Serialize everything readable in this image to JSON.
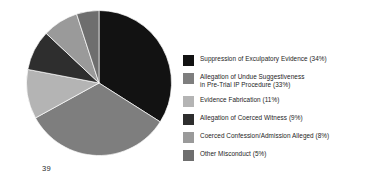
{
  "page": {
    "number": "39"
  },
  "chart_data": {
    "type": "pie",
    "title": "",
    "xlabel": "",
    "ylabel": "",
    "legend_position": "right",
    "grid": false,
    "start_angle_deg": 0,
    "direction": "clockwise",
    "categories": [
      "Suppression of Exculpatory Evidence",
      "Allegation of Undue Suggestiveness\nin Pre-Trial IP Procedure",
      "Evidence Fabrication",
      "Allegation of Coerced Witness",
      "Coerced Confession/Admission Alleged",
      "Other Misconduct"
    ],
    "values": [
      34,
      33,
      11,
      9,
      8,
      5
    ],
    "value_unit": "%",
    "colors": [
      "#121212",
      "#7e7e7e",
      "#b4b4b4",
      "#2e2e2e",
      "#9a9a9a",
      "#6e6e6e"
    ],
    "legend_entries": [
      {
        "label": "Suppression of Exculpatory Evidence (34%)",
        "value": 34,
        "color": "#121212"
      },
      {
        "label": "Allegation of Undue Suggestiveness\nin Pre-Trial IP Procedure (33%)",
        "value": 33,
        "color": "#7e7e7e"
      },
      {
        "label": "Evidence Fabrication (11%)",
        "value": 11,
        "color": "#b4b4b4"
      },
      {
        "label": "Allegation of Coerced Witness (9%)",
        "value": 9,
        "color": "#2e2e2e"
      },
      {
        "label": "Coerced Confession/Admission Alleged (8%)",
        "value": 8,
        "color": "#9a9a9a"
      },
      {
        "label": "Other Misconduct (5%)",
        "value": 5,
        "color": "#6e6e6e"
      }
    ]
  }
}
